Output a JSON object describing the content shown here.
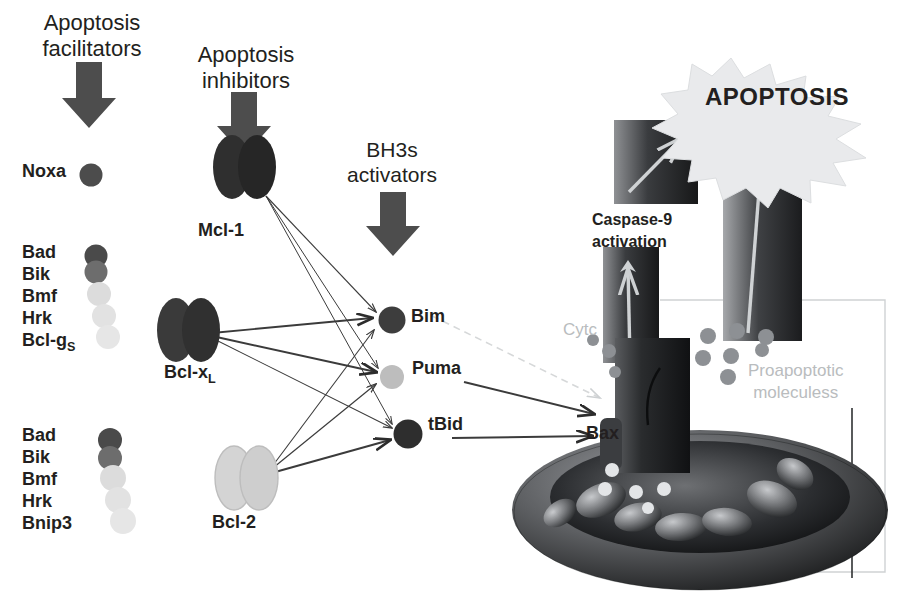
{
  "diagram": {
    "title_absent": true,
    "headers": [
      {
        "id": "facilitators",
        "text": "Apoptosis\nfacilitators",
        "x": 18,
        "y": 10,
        "w": 140,
        "size": 22
      },
      {
        "id": "inhibitors",
        "text": "Apoptosis\ninhibitors",
        "x": 172,
        "y": 42,
        "w": 140,
        "size": 22
      },
      {
        "id": "bh3s",
        "text": "BH3s\nactivators",
        "x": 322,
        "y": 138,
        "w": 130,
        "size": 21
      }
    ],
    "down_arrows": [
      {
        "id": "arrow-facilitators",
        "x": 88,
        "y": 65,
        "h": 62,
        "color": "#4d4d4d"
      },
      {
        "id": "arrow-inhibitors",
        "x": 243,
        "y": 95,
        "h": 60,
        "color": "#4d4d4d"
      },
      {
        "id": "arrow-bh3s",
        "x": 392,
        "y": 192,
        "h": 62,
        "color": "#4d4d4d"
      }
    ],
    "proteins": {
      "noxa": {
        "label": "Noxa",
        "cx": 91,
        "cy": 175,
        "r": 11,
        "color": "#4c4c4c",
        "label_x": 22,
        "label_y": 163
      },
      "mcl1": {
        "label": "Mcl-1",
        "cx": 245,
        "cy": 165,
        "color": "#2f2f2f",
        "label_x": 196,
        "label_y": 222
      },
      "bclxl": {
        "label": "Bcl-x",
        "sub": "L",
        "cx": 188,
        "cy": 330,
        "color": "#3a3a3a",
        "label_x": 163,
        "label_y": 363
      },
      "bcl2": {
        "label": "Bcl-2",
        "cx": 246,
        "cy": 478,
        "color": "#cfcfcf",
        "label_x": 211,
        "label_y": 513
      },
      "bim": {
        "label": "Bim",
        "cx": 392,
        "cy": 320,
        "r": 13,
        "color": "#3d3d3d",
        "label_x": 410,
        "label_y": 307
      },
      "puma": {
        "label": "Puma",
        "cx": 392,
        "cy": 377,
        "r": 12,
        "color": "#bdbdbd",
        "label_x": 411,
        "label_y": 359
      },
      "tbid": {
        "label": "tBid",
        "cx": 408,
        "cy": 434,
        "r": 14,
        "color": "#2e2e2e",
        "label_x": 427,
        "label_y": 414
      },
      "bax": {
        "label": "Bax",
        "label_x": 586,
        "label_y": 425
      }
    },
    "lists": [
      {
        "id": "list-1",
        "x": 22,
        "y": 243,
        "items": [
          "Bad",
          "Bik",
          "Bmf",
          "Hrk",
          "Bcl-g"
        ],
        "sub_last": "S",
        "beads": [
          {
            "cx": 96,
            "cy": 256,
            "r": 11,
            "color": "#4a4a4a"
          },
          {
            "cx": 96,
            "cy": 272,
            "r": 11,
            "color": "#6d6d6d"
          },
          {
            "cx": 99,
            "cy": 294,
            "r": 12,
            "color": "#dcdcdc"
          },
          {
            "cx": 104,
            "cy": 316,
            "r": 12,
            "color": "#e2e2e2"
          },
          {
            "cx": 108,
            "cy": 337,
            "r": 12,
            "color": "#e6e6e6"
          }
        ]
      },
      {
        "id": "list-2",
        "x": 22,
        "y": 425,
        "items": [
          "Bad",
          "Bik",
          "Bmf",
          "Hrk",
          "Bnip3"
        ],
        "beads": [
          {
            "cx": 110,
            "cy": 440,
            "r": 12,
            "color": "#4a4a4a"
          },
          {
            "cx": 110,
            "cy": 458,
            "r": 12,
            "color": "#6d6d6d"
          },
          {
            "cx": 113,
            "cy": 478,
            "r": 13,
            "color": "#dcdcdc"
          },
          {
            "cx": 118,
            "cy": 500,
            "r": 13,
            "color": "#e2e2e2"
          },
          {
            "cx": 123,
            "cy": 521,
            "r": 13,
            "color": "#e6e6e6"
          }
        ]
      }
    ],
    "right_panel": {
      "apoptosis_label": "APOPTOSIS",
      "apoptosis_x": 686,
      "apoptosis_y": 82,
      "apoptosis_size": 23,
      "caspase_label": "Caspase-9\nactivation",
      "caspase_x": 592,
      "caspase_y": 212,
      "caspase_size": 16,
      "cytc_label": "Cytc",
      "cytc_x": 565,
      "cytc_y": 322,
      "cytc_size": 17,
      "proapoptotic_label": "Proapoptotic\nmoleculess",
      "proapoptotic_x": 752,
      "proapoptotic_y": 362,
      "proapoptotic_size": 17,
      "blocks": [
        {
          "id": "block-caspase-small",
          "x": 614,
          "y": 120,
          "w": 84,
          "h": 84
        },
        {
          "id": "block-caspase-stalk",
          "x": 603,
          "y": 250,
          "w": 56,
          "h": 110
        },
        {
          "id": "block-apoptosis-tall",
          "x": 723,
          "y": 127,
          "w": 79,
          "h": 212
        },
        {
          "id": "block-bax-channel",
          "x": 617,
          "y": 338,
          "w": 72,
          "h": 130
        }
      ],
      "pale_arrows": [
        {
          "id": "pale-arrow-1",
          "x1": 629,
          "y1": 190,
          "x2": 686,
          "y2": 134
        },
        {
          "id": "pale-arrow-2",
          "x1": 630,
          "y1": 362,
          "x2": 627,
          "y2": 262
        },
        {
          "id": "pale-arrow-3",
          "x1": 749,
          "y1": 330,
          "x2": 763,
          "y2": 148
        }
      ],
      "molecule_dots": [
        {
          "cx": 708,
          "cy": 337,
          "r": 8
        },
        {
          "cx": 737,
          "cy": 333,
          "r": 8
        },
        {
          "cx": 764,
          "cy": 338,
          "r": 8
        },
        {
          "cx": 704,
          "cy": 358,
          "r": 8
        },
        {
          "cx": 731,
          "cy": 356,
          "r": 8
        },
        {
          "cx": 760,
          "cy": 352,
          "r": 7
        },
        {
          "cx": 727,
          "cy": 376,
          "r": 8
        },
        {
          "cx": 609,
          "cy": 352,
          "r": 7
        },
        {
          "cx": 614,
          "cy": 372,
          "r": 6
        }
      ]
    },
    "colors": {
      "dark_protein": "#333333",
      "light_protein": "#cfcfcf",
      "arrow_gray": "#4d4d4d",
      "line": "#3b3b3b",
      "faint_line": "#d6d8d9",
      "ghost_text": "#b9bcbe",
      "starburst": "#e9eaec"
    },
    "edges": [
      {
        "from": "mcl1",
        "to": "bim",
        "weight": "thin"
      },
      {
        "from": "mcl1",
        "to": "puma",
        "weight": "thin"
      },
      {
        "from": "mcl1",
        "to": "tbid",
        "weight": "thin"
      },
      {
        "from": "bclxl",
        "to": "bim",
        "weight": "thick"
      },
      {
        "from": "bclxl",
        "to": "puma",
        "weight": "thick"
      },
      {
        "from": "bclxl",
        "to": "tbid",
        "weight": "thin"
      },
      {
        "from": "bcl2",
        "to": "bim",
        "weight": "thin"
      },
      {
        "from": "bcl2",
        "to": "puma",
        "weight": "thin"
      },
      {
        "from": "bcl2",
        "to": "tbid",
        "weight": "thick"
      },
      {
        "from": "puma",
        "to": "bax",
        "weight": "thick"
      },
      {
        "from": "tbid",
        "to": "bax",
        "weight": "thick"
      },
      {
        "from": "bim",
        "to": "bax",
        "weight": "faint"
      }
    ]
  }
}
